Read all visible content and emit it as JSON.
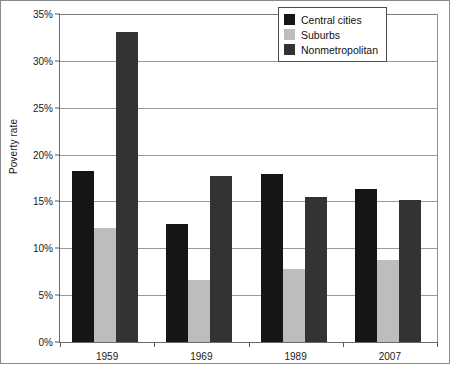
{
  "chart_data": {
    "type": "bar",
    "title": "",
    "subtitle": "",
    "xlabel": "",
    "ylabel": "Poverty rate",
    "categories": [
      "1959",
      "1969",
      "1989",
      "2007"
    ],
    "series": [
      {
        "name": "Central cities",
        "color": "#151515",
        "values": [
          18.3,
          12.6,
          17.9,
          16.3
        ]
      },
      {
        "name": "Suburbs",
        "color": "#bdbdbd",
        "values": [
          12.2,
          6.6,
          7.8,
          8.8
        ]
      },
      {
        "name": "Nonmetropolitan",
        "color": "#333333",
        "values": [
          33.1,
          17.7,
          15.5,
          15.2
        ]
      }
    ],
    "ylim": [
      0,
      35
    ],
    "ytick_values": [
      0,
      5,
      10,
      15,
      20,
      25,
      30,
      35
    ],
    "ytick_labels": [
      "0%",
      "5%",
      "10%",
      "15%",
      "20%",
      "25%",
      "30%",
      "35%"
    ],
    "ytick_format": "percent",
    "grid": true,
    "grid_axis": "y",
    "legend_position": "top-right",
    "legend_entries": [
      "Central cities",
      "Suburbs",
      "Nonmetropolitan"
    ],
    "annotations": [],
    "bar_group_gap_ratio": 0.45
  }
}
